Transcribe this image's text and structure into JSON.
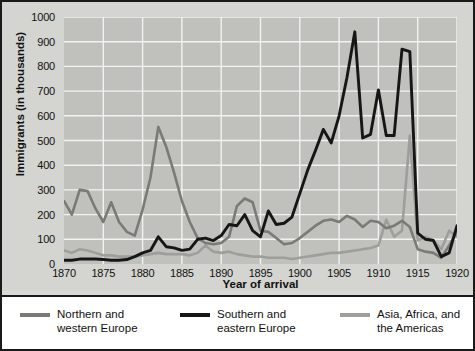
{
  "chart_data": {
    "type": "line",
    "title": "",
    "xlabel": "Year of arrival",
    "ylabel": "Immigrants (in thousands)",
    "xlim": [
      1870,
      1920
    ],
    "ylim": [
      0,
      1000
    ],
    "xticks": [
      1870,
      1875,
      1880,
      1885,
      1890,
      1895,
      1900,
      1905,
      1910,
      1915,
      1920
    ],
    "yticks": [
      0,
      100,
      200,
      300,
      400,
      500,
      600,
      700,
      800,
      900,
      1000
    ],
    "grid": true,
    "legend_position": "bottom",
    "x": [
      1870,
      1871,
      1872,
      1873,
      1874,
      1875,
      1876,
      1877,
      1878,
      1879,
      1880,
      1881,
      1882,
      1883,
      1884,
      1885,
      1886,
      1887,
      1888,
      1889,
      1890,
      1891,
      1892,
      1893,
      1894,
      1895,
      1896,
      1897,
      1898,
      1899,
      1900,
      1901,
      1902,
      1903,
      1904,
      1905,
      1906,
      1907,
      1908,
      1909,
      1910,
      1911,
      1912,
      1913,
      1914,
      1915,
      1916,
      1917,
      1918,
      1919,
      1920
    ],
    "series": [
      {
        "name": "Northern and western Europe",
        "color": "#7a7a76",
        "values": [
          255,
          200,
          300,
          295,
          225,
          170,
          250,
          170,
          130,
          115,
          220,
          350,
          555,
          475,
          370,
          255,
          170,
          105,
          85,
          80,
          85,
          110,
          235,
          265,
          250,
          135,
          130,
          105,
          80,
          85,
          105,
          130,
          155,
          175,
          180,
          170,
          195,
          180,
          150,
          175,
          170,
          145,
          155,
          175,
          150,
          60,
          50,
          45,
          25,
          75,
          130
        ]
      },
      {
        "name": "Southern and eastern Europe",
        "color": "#161616",
        "values": [
          15,
          15,
          20,
          20,
          20,
          18,
          15,
          15,
          18,
          30,
          45,
          55,
          110,
          70,
          65,
          55,
          60,
          100,
          105,
          95,
          115,
          160,
          155,
          200,
          135,
          110,
          215,
          160,
          165,
          190,
          285,
          380,
          460,
          545,
          490,
          600,
          755,
          940,
          510,
          525,
          705,
          520,
          520,
          870,
          860,
          125,
          100,
          95,
          30,
          45,
          155
        ]
      },
      {
        "name": "Asia, Africa, and the Americas",
        "color": "#9e9e9a",
        "values": [
          55,
          45,
          60,
          55,
          45,
          35,
          35,
          30,
          30,
          30,
          35,
          40,
          45,
          40,
          40,
          40,
          35,
          45,
          75,
          50,
          45,
          50,
          40,
          35,
          30,
          30,
          25,
          25,
          25,
          20,
          25,
          30,
          35,
          40,
          45,
          45,
          50,
          55,
          60,
          65,
          75,
          180,
          110,
          135,
          520,
          95,
          110,
          95,
          60,
          135,
          110
        ]
      }
    ]
  },
  "axis": {
    "ytick_labels": [
      "1000",
      "900",
      "800",
      "700",
      "600",
      "500",
      "400",
      "300",
      "200",
      "100",
      "0"
    ],
    "xtick_labels": [
      "1870",
      "1875",
      "1880",
      "1885",
      "1890",
      "1895",
      "1900",
      "1905",
      "1910",
      "1915",
      "1920"
    ],
    "ylabel": "Immigrants (in thousands)",
    "xlabel": "Year of arrival"
  },
  "legend": {
    "items": [
      {
        "label": "Northern and\nwestern Europe",
        "color": "#7a7a76"
      },
      {
        "label": "Southern and\neastern Europe",
        "color": "#161616"
      },
      {
        "label": "Asia, Africa, and the Americas",
        "color": "#9e9e9a"
      }
    ]
  }
}
